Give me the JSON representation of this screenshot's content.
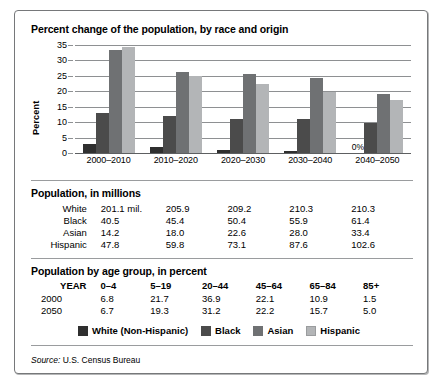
{
  "chart_data": {
    "type": "bar",
    "title": "Percent change of the population, by race and origin",
    "xlabel": "",
    "ylabel": "Percent",
    "ylim": [
      0,
      35
    ],
    "yticks": [
      0,
      5,
      10,
      15,
      20,
      25,
      30,
      35
    ],
    "grid": true,
    "legend_position": "bottom",
    "categories": [
      "2000–2010",
      "2010–2020",
      "2020–2030",
      "2030–2040",
      "2040–2050"
    ],
    "series": [
      {
        "name": "White (Non-Hispanic)",
        "color": "#2f2f2f",
        "values": [
          2.9,
          1.8,
          1.1,
          0.8,
          0.0
        ]
      },
      {
        "name": "Black",
        "color": "#4b4b4b",
        "values": [
          13.1,
          12.1,
          11.0,
          10.9,
          9.8
        ]
      },
      {
        "name": "Asian",
        "color": "#6f7173",
        "values": [
          33.4,
          26.3,
          25.6,
          24.4,
          19.2
        ]
      },
      {
        "name": "Hispanic",
        "color": "#b3b5b7",
        "values": [
          34.4,
          24.9,
          22.3,
          19.9,
          17.1
        ]
      }
    ],
    "annotations": [
      {
        "text": "0%",
        "category": "2040–2050",
        "series": "White (Non-Hispanic)"
      }
    ]
  },
  "chart": {
    "title": "Percent change of the population, by race and origin",
    "y_axis_label": "Percent",
    "y_ticks": [
      "35",
      "30",
      "25",
      "20",
      "15",
      "10",
      "5",
      "0"
    ],
    "x_labels": [
      "2000–2010",
      "2010–2020",
      "2020–2030",
      "2030–2040",
      "2040–2050"
    ],
    "zero_annotation": "0%"
  },
  "population_table": {
    "title": "Population, in millions",
    "rows": [
      {
        "label": "White",
        "values": [
          "201.1 mil.",
          "205.9",
          "209.2",
          "210.3",
          "210.3"
        ]
      },
      {
        "label": "Black",
        "values": [
          "40.5",
          "45.4",
          "50.4",
          "55.9",
          "61.4"
        ]
      },
      {
        "label": "Asian",
        "values": [
          "14.2",
          "18.0",
          "22.6",
          "28.0",
          "33.4"
        ]
      },
      {
        "label": "Hispanic",
        "values": [
          "47.8",
          "59.8",
          "73.1",
          "87.6",
          "102.6"
        ]
      }
    ]
  },
  "age_table": {
    "title": "Population by age group, in percent",
    "header": {
      "label": "YEAR",
      "values": [
        "0–4",
        "5–19",
        "20–44",
        "45–64",
        "65–84",
        "85+"
      ]
    },
    "rows": [
      {
        "label": "2000",
        "values": [
          "6.8",
          "21.7",
          "36.9",
          "22.1",
          "10.9",
          "1.5"
        ]
      },
      {
        "label": "2050",
        "values": [
          "6.7",
          "19.3",
          "31.2",
          "22.2",
          "15.7",
          "5.0"
        ]
      }
    ]
  },
  "legend": {
    "items": [
      {
        "label": "White (Non-Hispanic)",
        "color": "#2f2f2f"
      },
      {
        "label": "Black",
        "color": "#4b4b4b"
      },
      {
        "label": "Asian",
        "color": "#6f7173"
      },
      {
        "label": "Hispanic",
        "color": "#b3b5b7"
      }
    ]
  },
  "source": {
    "label": "Source:",
    "text": "U.S. Census Bureau"
  }
}
